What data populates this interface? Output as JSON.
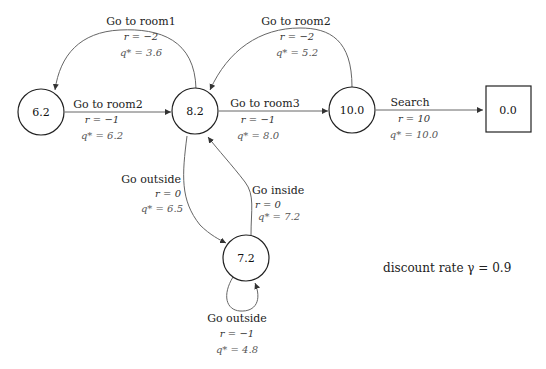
{
  "diagram": {
    "type": "mdp-state-graph",
    "states": [
      {
        "id": "s1",
        "value": "6.2",
        "shape": "circle"
      },
      {
        "id": "s2",
        "value": "8.2",
        "shape": "circle"
      },
      {
        "id": "s3",
        "value": "10.0",
        "shape": "circle"
      },
      {
        "id": "s4",
        "value": "0.0",
        "shape": "square"
      },
      {
        "id": "s5",
        "value": "7.2",
        "shape": "circle"
      }
    ],
    "edges": [
      {
        "from": "s2",
        "to": "s1",
        "action": "Go to room1",
        "r": "r = −2",
        "q": "q* = 3.6"
      },
      {
        "from": "s1",
        "to": "s2",
        "action": "Go to room2",
        "r": "r = −1",
        "q": "q* = 6.2"
      },
      {
        "from": "s3",
        "to": "s2",
        "action": "Go to room2",
        "r": "r = −2",
        "q": "q* = 5.2"
      },
      {
        "from": "s2",
        "to": "s3",
        "action": "Go to room3",
        "r": "r = −1",
        "q": "q* = 8.0"
      },
      {
        "from": "s3",
        "to": "s4",
        "action": "Search",
        "r": "r = 10",
        "q": "q* = 10.0"
      },
      {
        "from": "s2",
        "to": "s5",
        "action": "Go outside",
        "r": "r = 0",
        "q": "q* = 6.5"
      },
      {
        "from": "s5",
        "to": "s2",
        "action": "Go inside",
        "r": "r = 0",
        "q": "q* = 7.2"
      },
      {
        "from": "s5",
        "to": "s5",
        "action": "Go outside",
        "r": "r = −1",
        "q": "q* = 4.8"
      }
    ],
    "discount": "discount rate γ = 0.9"
  }
}
